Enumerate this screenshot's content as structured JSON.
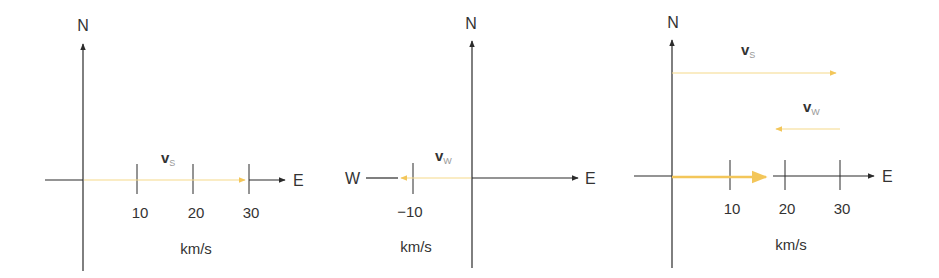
{
  "colors": {
    "axis": "#2b2b2b",
    "vector": "#f3c65a",
    "vector_light": "#f6d98a",
    "text": "#333333"
  },
  "panels": [
    {
      "north_label": "N",
      "east_label": "E",
      "units": "km/s",
      "ticks": [
        "10",
        "20",
        "30"
      ],
      "vectors": [
        {
          "label": "v",
          "subscript": "S",
          "value": 29
        }
      ]
    },
    {
      "north_label": "N",
      "east_label": "E",
      "west_label": "W",
      "units": "km/s",
      "ticks": [
        "−10"
      ],
      "vectors": [
        {
          "label": "v",
          "subscript": "W",
          "value": -12
        }
      ]
    },
    {
      "north_label": "N",
      "east_label": "E",
      "units": "km/s",
      "ticks": [
        "10",
        "20",
        "30"
      ],
      "vectors": [
        {
          "label": "v",
          "subscript": "S",
          "value": 30
        },
        {
          "label": "v",
          "subscript": "W",
          "value": -12
        },
        {
          "label": "",
          "subscript": "",
          "value": 17
        }
      ]
    }
  ]
}
